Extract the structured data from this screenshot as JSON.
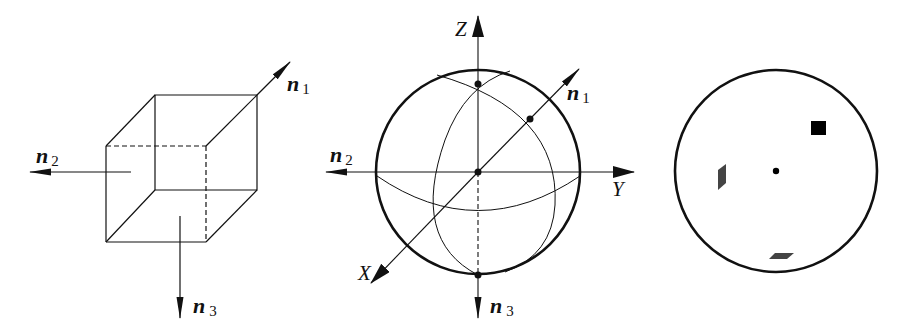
{
  "figure": {
    "panels": [
      {
        "id": "cube",
        "description": "Cube with three face normals",
        "labels": {
          "n1": {
            "main": "n",
            "sub": "1"
          },
          "n2": {
            "main": "n",
            "sub": "2"
          },
          "n3": {
            "main": "n",
            "sub": "3"
          }
        }
      },
      {
        "id": "sphere",
        "description": "Reference sphere with face-normal poles",
        "axes": {
          "x": "X",
          "y": "Y",
          "z": "Z"
        },
        "labels": {
          "n1": {
            "main": "n",
            "sub": "1"
          },
          "n2": {
            "main": "n",
            "sub": "2"
          },
          "n3": {
            "main": "n",
            "sub": "3"
          }
        }
      },
      {
        "id": "stereographic-projection",
        "description": "Projection circle with pole symbols",
        "symbols": [
          "square",
          "center-dot",
          "parallelogram-left",
          "parallelogram-bottom"
        ]
      }
    ],
    "colors": {
      "stroke": "#111111",
      "fill_dark": "#000000",
      "fill_gray": "#444444",
      "background": "#ffffff"
    }
  }
}
